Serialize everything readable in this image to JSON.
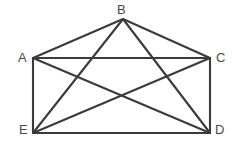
{
  "figure": {
    "background_color": "#ffffff",
    "line_color": "#3b3b3b",
    "label_color": "#4a4a4a",
    "line_width": 2.1,
    "canvas": {
      "width": 232,
      "height": 150
    }
  },
  "vertices": [
    {
      "id": "B",
      "label": "B",
      "x": 123,
      "y": 19,
      "label_x": 117,
      "label_y": 3
    },
    {
      "id": "A",
      "label": "A",
      "x": 33,
      "y": 58,
      "label_x": 18,
      "label_y": 51
    },
    {
      "id": "C",
      "label": "C",
      "x": 210,
      "y": 58,
      "label_x": 216,
      "label_y": 51
    },
    {
      "id": "E",
      "label": "E",
      "x": 33,
      "y": 133,
      "label_x": 19,
      "label_y": 123
    },
    {
      "id": "D",
      "label": "D",
      "x": 210,
      "y": 133,
      "label_x": 215,
      "label_y": 123
    }
  ],
  "edges": [
    {
      "id": "AB",
      "from": "A",
      "to": "B",
      "x1": 33,
      "y1": 58,
      "x2": 123,
      "y2": 19
    },
    {
      "id": "BC",
      "from": "B",
      "to": "C",
      "x1": 123,
      "y1": 19,
      "x2": 210,
      "y2": 58
    },
    {
      "id": "AC",
      "from": "A",
      "to": "C",
      "x1": 33,
      "y1": 58,
      "x2": 210,
      "y2": 58
    },
    {
      "id": "AE",
      "from": "A",
      "to": "E",
      "x1": 33,
      "y1": 58,
      "x2": 33,
      "y2": 133
    },
    {
      "id": "CD",
      "from": "C",
      "to": "D",
      "x1": 210,
      "y1": 58,
      "x2": 210,
      "y2": 133
    },
    {
      "id": "ED",
      "from": "E",
      "to": "D",
      "x1": 33,
      "y1": 133,
      "x2": 210,
      "y2": 133
    },
    {
      "id": "BE",
      "from": "B",
      "to": "E",
      "x1": 123,
      "y1": 19,
      "x2": 33,
      "y2": 133
    },
    {
      "id": "BD",
      "from": "B",
      "to": "D",
      "x1": 123,
      "y1": 19,
      "x2": 210,
      "y2": 133
    },
    {
      "id": "AD",
      "from": "A",
      "to": "D",
      "x1": 33,
      "y1": 58,
      "x2": 210,
      "y2": 133
    },
    {
      "id": "CE",
      "from": "C",
      "to": "E",
      "x1": 210,
      "y1": 58,
      "x2": 33,
      "y2": 133
    }
  ]
}
